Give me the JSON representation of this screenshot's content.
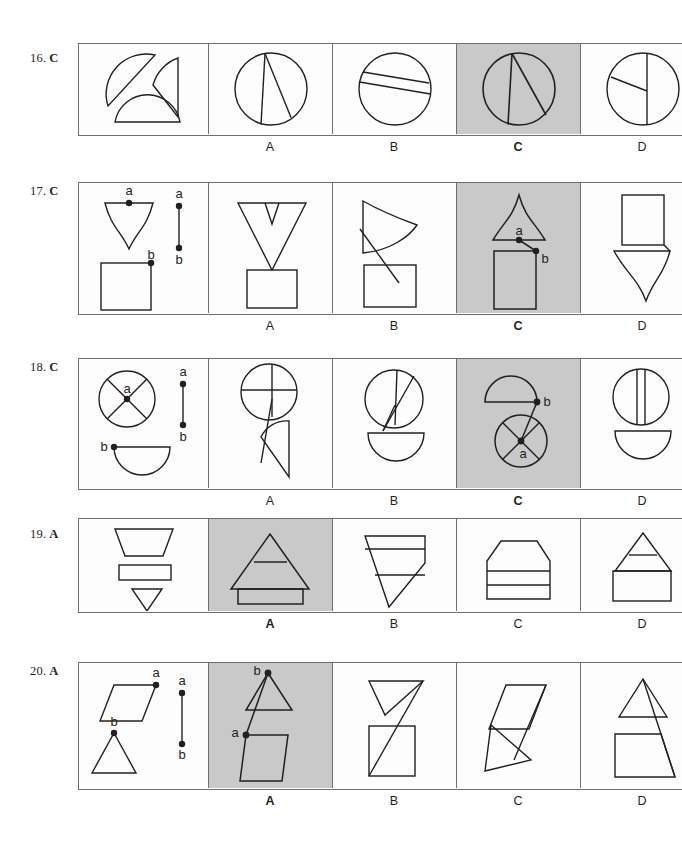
{
  "page": {
    "width": 682,
    "height": 844,
    "background": "#ffffff",
    "stroke_color": "#231f20",
    "border_color": "#6f6f6f",
    "shaded_color": "#c9c9c9"
  },
  "choice_letters": [
    "A",
    "B",
    "C",
    "D"
  ],
  "point_labels": {
    "a": "a",
    "b": "b"
  },
  "questions": [
    {
      "number": "16.",
      "answer": "C",
      "top": 43,
      "height": 93,
      "prompt_width": 130,
      "choice_width": 124,
      "choices": [
        "A",
        "B",
        "C",
        "D"
      ],
      "correct_index": 2
    },
    {
      "number": "17.",
      "answer": "C",
      "top": 182,
      "height": 133,
      "prompt_width": 130,
      "choice_width": 124,
      "choices": [
        "A",
        "B",
        "C",
        "D"
      ],
      "correct_index": 2
    },
    {
      "number": "18.",
      "answer": "C",
      "top": 358,
      "height": 132,
      "prompt_width": 130,
      "choice_width": 124,
      "choices": [
        "A",
        "B",
        "C",
        "D"
      ],
      "correct_index": 2
    },
    {
      "number": "19.",
      "answer": "A",
      "top": 518,
      "height": 95,
      "prompt_width": 130,
      "choice_width": 124,
      "choices": [
        "A",
        "B",
        "C",
        "D"
      ],
      "correct_index": 0
    },
    {
      "number": "20.",
      "answer": "A",
      "top": 662,
      "height": 128,
      "prompt_width": 130,
      "choice_width": 124,
      "choices": [
        "A",
        "B",
        "C",
        "D"
      ],
      "correct_index": 0
    }
  ]
}
